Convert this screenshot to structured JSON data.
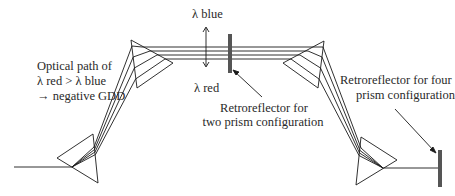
{
  "diagram": {
    "labels": {
      "lambda_blue": "λ blue",
      "lambda_red": "λ red",
      "optical_path_line1": "Optical path of",
      "optical_path_line2": "λ red > λ blue",
      "optical_path_line3": "→ negative GDD",
      "retro_two_line1": "Retroreflector for",
      "retro_two_line2": "two prism configuration",
      "retro_four_line1": "Retroreflector for four",
      "retro_four_line2": "prism configuration"
    },
    "components": [
      {
        "id": "prism-1",
        "type": "prism",
        "vertices": [
          [
            57,
            158
          ],
          [
            93,
            134
          ],
          [
            98,
            183
          ]
        ]
      },
      {
        "id": "prism-2",
        "type": "prism",
        "vertices": [
          [
            131,
            40
          ],
          [
            173,
            63
          ],
          [
            137,
            88
          ]
        ]
      },
      {
        "id": "prism-3",
        "type": "prism",
        "vertices": [
          [
            324,
            41
          ],
          [
            283,
            63
          ],
          [
            318,
            88
          ]
        ]
      },
      {
        "id": "prism-4",
        "type": "prism",
        "vertices": [
          [
            361,
            137
          ],
          [
            397,
            160
          ],
          [
            356,
            185
          ]
        ]
      },
      {
        "id": "retroreflector-two-prism",
        "type": "mirror",
        "x": 228,
        "y": 34,
        "w": 4,
        "h": 39
      },
      {
        "id": "retroreflector-four-prism",
        "type": "mirror",
        "x": 438,
        "y": 150,
        "w": 4,
        "h": 37
      }
    ],
    "colors": {
      "line": "#1a1a1a",
      "mirror": "#555555",
      "text": "#2a2a2a"
    }
  }
}
